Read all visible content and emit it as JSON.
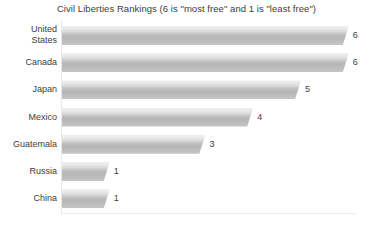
{
  "chart_data": {
    "type": "bar",
    "orientation": "horizontal",
    "title": "Civil Liberties Rankings (6 is \"most free\" and 1 is \"least free\")",
    "xlabel": "",
    "ylabel": "",
    "categories": [
      "United States",
      "Canada",
      "Japan",
      "Mexico",
      "Guatemala",
      "Russia",
      "China"
    ],
    "values": [
      6,
      6,
      5,
      4,
      3,
      1,
      1
    ],
    "value_labels": [
      "6",
      "6",
      "5",
      "4",
      "3",
      "1",
      "1"
    ],
    "xlim": [
      0,
      6
    ],
    "grid": false,
    "legend": false,
    "bar_color": "#bdbdbd",
    "bar_color_light": "#efefef",
    "text_color": "#3c3c3c",
    "background": "#ffffff"
  }
}
